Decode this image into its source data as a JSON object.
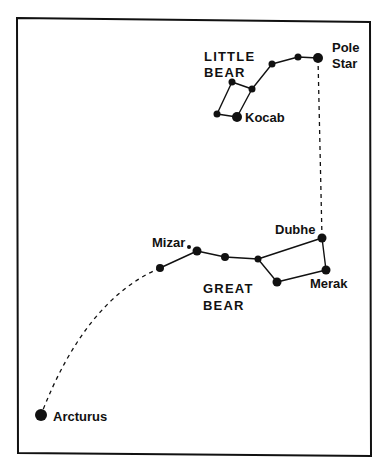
{
  "diagram": {
    "type": "star-chart",
    "colors": {
      "background": "#ffffff",
      "ink": "#111111"
    },
    "frame": {
      "points": [
        [
          17,
          18
        ],
        [
          370,
          22
        ],
        [
          371,
          456
        ],
        [
          18,
          453
        ]
      ]
    },
    "label_font_size": 13,
    "stars": [
      {
        "id": "pole-star",
        "name": "Pole Star",
        "x": 318,
        "y": 58,
        "r": 5
      },
      {
        "id": "lb-2",
        "name": "",
        "x": 298,
        "y": 57,
        "r": 3.5
      },
      {
        "id": "lb-3",
        "name": "",
        "x": 272,
        "y": 64,
        "r": 3.5
      },
      {
        "id": "lb-4",
        "name": "",
        "x": 252,
        "y": 89,
        "r": 3.5
      },
      {
        "id": "lb-5",
        "name": "",
        "x": 232,
        "y": 82,
        "r": 3.5
      },
      {
        "id": "lb-6",
        "name": "",
        "x": 217,
        "y": 114,
        "r": 3.5
      },
      {
        "id": "kocab",
        "name": "Kocab",
        "x": 237,
        "y": 117,
        "r": 5
      },
      {
        "id": "dubhe",
        "name": "Dubhe",
        "x": 322,
        "y": 238,
        "r": 4.5
      },
      {
        "id": "merak",
        "name": "Merak",
        "x": 326,
        "y": 270,
        "r": 4.5
      },
      {
        "id": "gb-bowl-bl",
        "name": "",
        "x": 277,
        "y": 282,
        "r": 4.5
      },
      {
        "id": "gb-bowl-tl",
        "name": "",
        "x": 258,
        "y": 259,
        "r": 3.5
      },
      {
        "id": "gb-handle-1",
        "name": "",
        "x": 225,
        "y": 257,
        "r": 4
      },
      {
        "id": "mizar",
        "name": "Mizar",
        "x": 197,
        "y": 251,
        "r": 4.5
      },
      {
        "id": "alcor",
        "name": "",
        "x": 189,
        "y": 247,
        "r": 2
      },
      {
        "id": "gb-handle-end",
        "name": "",
        "x": 160,
        "y": 268,
        "r": 4
      },
      {
        "id": "arcturus",
        "name": "Arcturus",
        "x": 41,
        "y": 415,
        "r": 6
      }
    ],
    "constellation_lines": [
      {
        "name": "little-bear",
        "points": [
          [
            318,
            58
          ],
          [
            298,
            57
          ],
          [
            272,
            64
          ],
          [
            252,
            89
          ],
          [
            237,
            117
          ],
          [
            217,
            114
          ],
          [
            232,
            82
          ],
          [
            252,
            89
          ]
        ]
      },
      {
        "name": "great-bear",
        "points": [
          [
            160,
            268
          ],
          [
            197,
            251
          ],
          [
            225,
            257
          ],
          [
            258,
            259
          ],
          [
            322,
            238
          ],
          [
            326,
            270
          ],
          [
            277,
            282
          ],
          [
            258,
            259
          ]
        ]
      }
    ],
    "pointer_lines": [
      {
        "name": "dubhe-to-pole-star",
        "path": "M 322 238 L 318 58"
      },
      {
        "name": "handle-to-arcturus",
        "path": "M 160 268 Q 85 300 41 415"
      }
    ],
    "labels": [
      {
        "id": "little-bear",
        "lines": [
          "LITTLE",
          "BEAR"
        ],
        "x": 204,
        "y": 61,
        "line_height": 16,
        "letter_spacing": 1.2
      },
      {
        "id": "pole-star",
        "lines": [
          "Pole",
          "Star"
        ],
        "x": 332,
        "y": 52,
        "line_height": 16,
        "letter_spacing": 0
      },
      {
        "id": "kocab",
        "lines": [
          "Kocab"
        ],
        "x": 245,
        "y": 122,
        "line_height": 16,
        "letter_spacing": 0
      },
      {
        "id": "dubhe",
        "lines": [
          "Dubhe"
        ],
        "x": 275,
        "y": 234,
        "line_height": 16,
        "letter_spacing": 0
      },
      {
        "id": "mizar",
        "lines": [
          "Mizar"
        ],
        "x": 152,
        "y": 247,
        "line_height": 16,
        "letter_spacing": 0
      },
      {
        "id": "merak",
        "lines": [
          "Merak"
        ],
        "x": 310,
        "y": 288,
        "line_height": 16,
        "letter_spacing": 0
      },
      {
        "id": "great-bear",
        "lines": [
          "GREAT",
          "BEAR"
        ],
        "x": 203,
        "y": 293,
        "line_height": 17,
        "letter_spacing": 1.2
      },
      {
        "id": "arcturus",
        "lines": [
          "Arcturus"
        ],
        "x": 53,
        "y": 421,
        "line_height": 16,
        "letter_spacing": 0
      }
    ]
  }
}
